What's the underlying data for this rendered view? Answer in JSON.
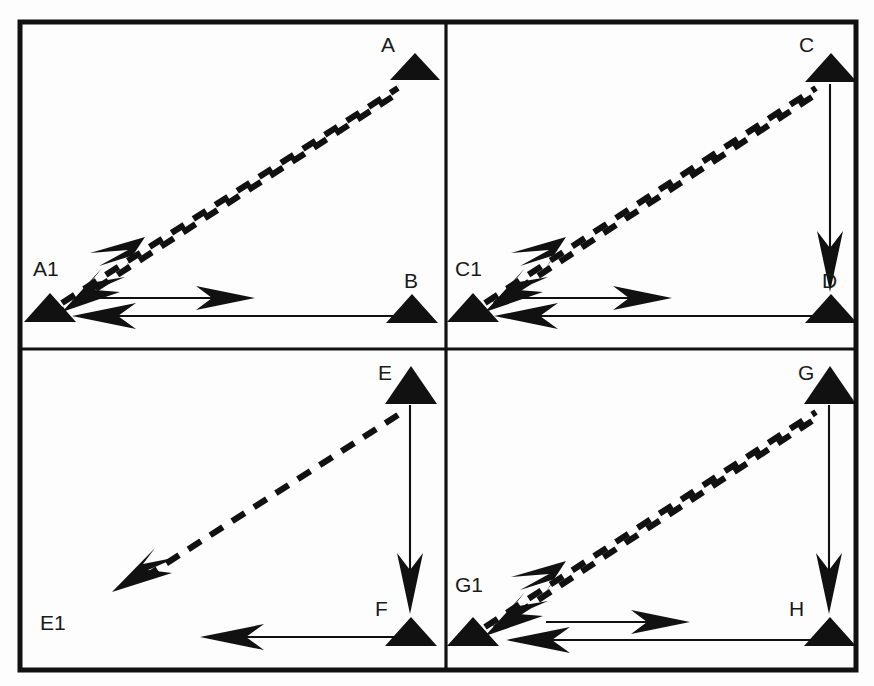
{
  "figure": {
    "background_color": "#fdfdfd",
    "ink_color": "#111111",
    "panel_count": 4
  },
  "panels": [
    {
      "id": "panel-top-left",
      "position": "top-left",
      "nodes": [
        {
          "id": "A",
          "label": "A",
          "shape": "triangle",
          "has_marker": true,
          "label_x": 387,
          "label_y": 52,
          "x": 415,
          "y": 80
        },
        {
          "id": "A1",
          "label": "A1",
          "shape": "triangle",
          "has_marker": true,
          "label_x": 33,
          "label_y": 276,
          "x": 50,
          "y": 322
        },
        {
          "id": "B",
          "label": "B",
          "shape": "triangle",
          "has_marker": true,
          "label_x": 403,
          "label_y": 288,
          "x": 412,
          "y": 322
        }
      ],
      "edges": [
        {
          "from": "A",
          "to": "A1",
          "style": "dashed",
          "direction": "both",
          "kind": "diagonal"
        },
        {
          "from": "A1",
          "to": "B",
          "style": "solid",
          "direction": "right",
          "kind": "horizontal"
        },
        {
          "from": "B",
          "to": "A1",
          "style": "solid",
          "direction": "left",
          "kind": "horizontal"
        }
      ]
    },
    {
      "id": "panel-top-right",
      "position": "top-right",
      "nodes": [
        {
          "id": "C",
          "label": "C",
          "shape": "triangle",
          "has_marker": true,
          "label_x": 803,
          "label_y": 52,
          "x": 831,
          "y": 80
        },
        {
          "id": "C1",
          "label": "C1",
          "shape": "triangle",
          "has_marker": true,
          "label_x": 455,
          "label_y": 276,
          "x": 473,
          "y": 322
        },
        {
          "id": "D",
          "label": "D",
          "shape": "triangle",
          "has_marker": true,
          "label_x": 822,
          "label_y": 288,
          "x": 831,
          "y": 322
        }
      ],
      "edges": [
        {
          "from": "C",
          "to": "C1",
          "style": "dashed",
          "direction": "both",
          "kind": "diagonal"
        },
        {
          "from": "C",
          "to": "D",
          "style": "solid",
          "direction": "down",
          "kind": "vertical"
        },
        {
          "from": "C1",
          "to": "D",
          "style": "solid",
          "direction": "right",
          "kind": "horizontal"
        },
        {
          "from": "D",
          "to": "C1",
          "style": "solid",
          "direction": "left",
          "kind": "horizontal"
        }
      ]
    },
    {
      "id": "panel-bottom-left",
      "position": "bottom-left",
      "nodes": [
        {
          "id": "E",
          "label": "E",
          "shape": "triangle",
          "has_marker": true,
          "label_x": 382,
          "label_y": 380,
          "x": 411,
          "y": 404
        },
        {
          "id": "E1",
          "label": "E1",
          "shape": "none",
          "has_marker": false,
          "label_x": 40,
          "label_y": 630,
          "x": 50,
          "y": 646
        },
        {
          "id": "F",
          "label": "F",
          "shape": "triangle",
          "has_marker": true,
          "label_x": 379,
          "label_y": 616,
          "x": 411,
          "y": 646
        }
      ],
      "edges": [
        {
          "from": "E",
          "to": "E1",
          "style": "dashed",
          "direction": "left-down",
          "kind": "diagonal-partial"
        },
        {
          "from": "E",
          "to": "F",
          "style": "solid",
          "direction": "down",
          "kind": "vertical"
        },
        {
          "from": "F",
          "to": "E1",
          "style": "solid",
          "direction": "left",
          "kind": "horizontal-partial"
        }
      ]
    },
    {
      "id": "panel-bottom-right",
      "position": "bottom-right",
      "nodes": [
        {
          "id": "G",
          "label": "G",
          "shape": "triangle",
          "has_marker": true,
          "label_x": 801,
          "label_y": 380,
          "x": 830,
          "y": 404
        },
        {
          "id": "G1",
          "label": "G1",
          "shape": "triangle",
          "has_marker": true,
          "label_x": 455,
          "label_y": 592,
          "x": 473,
          "y": 646
        },
        {
          "id": "H",
          "label": "H",
          "shape": "triangle",
          "has_marker": true,
          "label_x": 790,
          "label_y": 616,
          "x": 830,
          "y": 646
        }
      ],
      "edges": [
        {
          "from": "G",
          "to": "G1",
          "style": "dashed",
          "direction": "both",
          "kind": "diagonal"
        },
        {
          "from": "G",
          "to": "H",
          "style": "solid",
          "direction": "down",
          "kind": "vertical"
        },
        {
          "from": "G1",
          "to": "H",
          "style": "solid",
          "direction": "right",
          "kind": "horizontal"
        },
        {
          "from": "H",
          "to": "G1",
          "style": "solid",
          "direction": "left",
          "kind": "horizontal"
        }
      ]
    }
  ],
  "labels": {
    "A": "A",
    "A1": "A1",
    "B": "B",
    "C": "C",
    "C1": "C1",
    "D": "D",
    "E": "E",
    "E1": "E1",
    "F": "F",
    "G": "G",
    "G1": "G1",
    "H": "H"
  }
}
